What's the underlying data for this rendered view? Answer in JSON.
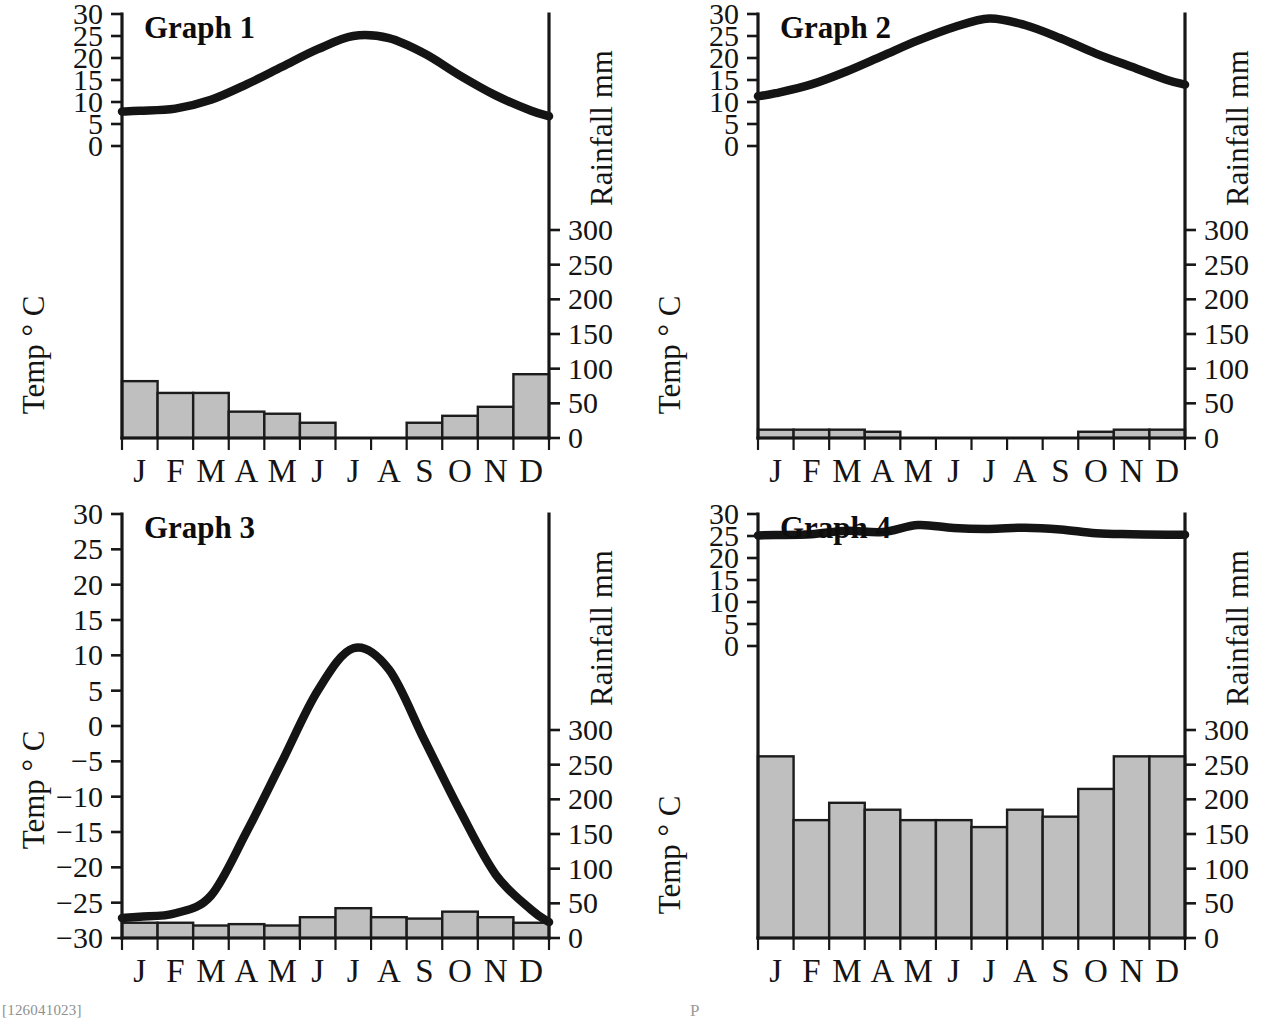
{
  "page": {
    "background_color": "#ffffff",
    "bar_fill_color": "#bfbfbf",
    "line_color": "#141414",
    "footer_mark": "[126041023]",
    "footer_mark_center": "P"
  },
  "common": {
    "temp_axis_title": "Temp ° C",
    "rain_axis_title": "Rainfall mm",
    "months": [
      "J",
      "F",
      "M",
      "A",
      "M",
      "J",
      "J",
      "A",
      "S",
      "O",
      "N",
      "D"
    ],
    "rain_ticks": [
      0,
      50,
      100,
      150,
      200,
      250,
      300
    ],
    "temp_ticks_standard": [
      0,
      5,
      10,
      15,
      20,
      25,
      30
    ],
    "temp_ticks_extended": [
      -30,
      -25,
      -20,
      -15,
      -10,
      -5,
      0,
      5,
      10,
      15,
      20,
      25,
      30
    ]
  },
  "chart_data": [
    {
      "id": "graph-1",
      "type": "line",
      "title": "Graph 1",
      "xlabel": "",
      "ylabel": "Temp ° C",
      "y2label": "Rainfall mm",
      "categories": [
        "J",
        "F",
        "M",
        "A",
        "M",
        "J",
        "J",
        "A",
        "S",
        "O",
        "N",
        "D"
      ],
      "series": [
        {
          "name": "Temperature",
          "type": "line",
          "unit": "°C",
          "axis": "left",
          "values": [
            8,
            8.5,
            10.5,
            14,
            18,
            22,
            25,
            24.5,
            21,
            16,
            11.5,
            8
          ]
        },
        {
          "name": "Rainfall",
          "type": "bar",
          "unit": "mm",
          "axis": "right",
          "values": [
            82,
            65,
            65,
            38,
            35,
            22,
            0,
            0,
            22,
            32,
            45,
            92
          ]
        }
      ],
      "ylim": [
        0,
        30
      ],
      "y2lim": [
        0,
        300
      ],
      "ytick_labels": [
        "0",
        "5",
        "10",
        "15",
        "20",
        "25",
        "30"
      ],
      "y2tick_labels": [
        "0",
        "50",
        "100",
        "150",
        "200",
        "250",
        "300"
      ],
      "grid": false,
      "legend": "none"
    },
    {
      "id": "graph-2",
      "type": "line",
      "title": "Graph 2",
      "xlabel": "",
      "ylabel": "Temp ° C",
      "y2label": "Rainfall mm",
      "categories": [
        "J",
        "F",
        "M",
        "A",
        "M",
        "J",
        "J",
        "A",
        "S",
        "O",
        "N",
        "D"
      ],
      "series": [
        {
          "name": "Temperature",
          "type": "line",
          "unit": "°C",
          "axis": "left",
          "values": [
            12,
            14,
            17,
            20.5,
            24,
            27,
            29,
            27.5,
            24.5,
            21,
            18,
            15
          ]
        },
        {
          "name": "Rainfall",
          "type": "bar",
          "unit": "mm",
          "axis": "right",
          "values": [
            12,
            12,
            12,
            9,
            0,
            0,
            0,
            0,
            0,
            9,
            12,
            12
          ]
        }
      ],
      "ylim": [
        0,
        30
      ],
      "y2lim": [
        0,
        300
      ],
      "ytick_labels": [
        "0",
        "5",
        "10",
        "15",
        "20",
        "25",
        "30"
      ],
      "y2tick_labels": [
        "0",
        "50",
        "100",
        "150",
        "200",
        "250",
        "300"
      ],
      "grid": false,
      "legend": "none"
    },
    {
      "id": "graph-3",
      "type": "line",
      "title": "Graph 3",
      "xlabel": "",
      "ylabel": "Temp ° C",
      "y2label": "Rainfall mm",
      "categories": [
        "J",
        "F",
        "M",
        "A",
        "M",
        "J",
        "J",
        "A",
        "S",
        "O",
        "N",
        "D"
      ],
      "series": [
        {
          "name": "Temperature",
          "type": "line",
          "unit": "°C",
          "axis": "left",
          "values": [
            -27,
            -26.5,
            -24,
            -15,
            -5,
            5,
            11,
            8,
            -2,
            -12,
            -21,
            -26
          ]
        },
        {
          "name": "Rainfall",
          "type": "bar",
          "unit": "mm",
          "axis": "right",
          "values": [
            22,
            22,
            18,
            20,
            18,
            30,
            43,
            30,
            28,
            38,
            30,
            22
          ]
        }
      ],
      "ylim": [
        -30,
        30
      ],
      "y2lim": [
        0,
        300
      ],
      "ytick_labels": [
        "−30",
        "−25",
        "−20",
        "−15",
        "−10",
        "−5",
        "0",
        "5",
        "10",
        "15",
        "20",
        "25",
        "30"
      ],
      "y2tick_labels": [
        "0",
        "50",
        "100",
        "150",
        "200",
        "250",
        "300"
      ],
      "grid": false,
      "legend": "none"
    },
    {
      "id": "graph-4",
      "type": "line",
      "title": "Graph 4",
      "xlabel": "",
      "ylabel": "Temp ° C",
      "y2label": "Rainfall mm",
      "categories": [
        "J",
        "F",
        "M",
        "A",
        "M",
        "J",
        "J",
        "A",
        "S",
        "O",
        "N",
        "D"
      ],
      "series": [
        {
          "name": "Temperature",
          "type": "line",
          "unit": "°C",
          "axis": "left",
          "values": [
            25.2,
            25.4,
            26.2,
            25.9,
            27.5,
            26.8,
            26.6,
            26.9,
            26.5,
            25.6,
            25.4,
            25.3
          ]
        },
        {
          "name": "Rainfall",
          "type": "bar",
          "unit": "mm",
          "axis": "right",
          "values": [
            262,
            170,
            195,
            185,
            170,
            170,
            160,
            185,
            175,
            215,
            262,
            262
          ]
        }
      ],
      "ylim": [
        0,
        30
      ],
      "y2lim": [
        0,
        300
      ],
      "ytick_labels": [
        "0",
        "5",
        "10",
        "15",
        "20",
        "25",
        "30"
      ],
      "y2tick_labels": [
        "0",
        "50",
        "100",
        "150",
        "200",
        "250",
        "300"
      ],
      "grid": false,
      "legend": "none"
    }
  ]
}
